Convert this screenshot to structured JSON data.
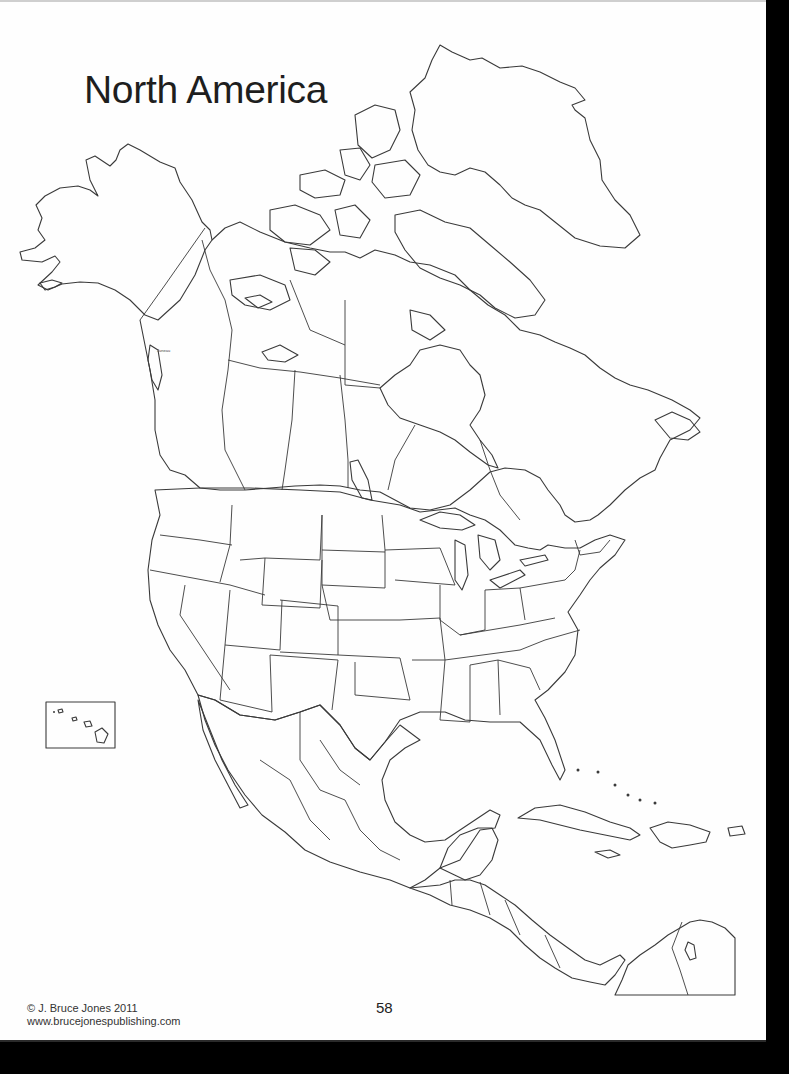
{
  "page": {
    "title": "North America",
    "page_number": "58",
    "footer": {
      "copyright": "© J. Bruce Jones 2011",
      "website": "www.brucejonespublishing.com"
    },
    "inset_label": "Hawaii inset",
    "tiny_label": "Juneau",
    "colors": {
      "paper": "#fefefe",
      "background": "#000000",
      "outline": "#3a3a3a",
      "text": "#1e1e1e"
    }
  },
  "map": {
    "type": "blank outline map",
    "regions_shown": [
      "Alaska",
      "Canada",
      "Greenland",
      "United States",
      "Mexico",
      "Central America",
      "Caribbean",
      "Hawaii (inset)",
      "Northern South America"
    ]
  }
}
